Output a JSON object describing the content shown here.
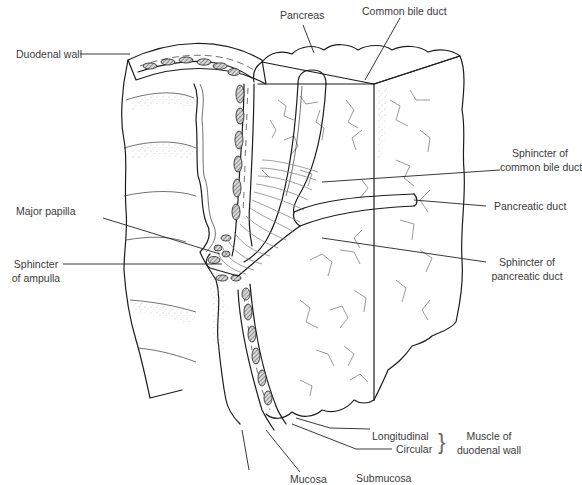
{
  "figure": {
    "style": "black line drawing on white",
    "colors": {
      "background": "#ffffff",
      "line": "#1c1c1c",
      "label_text": "#3b3b3b"
    }
  },
  "labels": {
    "duodenal_wall": "Duodenal wall",
    "pancreas": "Pancreas",
    "common_bile_duct": "Common bile duct",
    "sphincter_cbd_line1": "Sphincter of",
    "sphincter_cbd_line2": "common bile duct",
    "major_papilla": "Major papilla",
    "pancreatic_duct": "Pancreatic duct",
    "sphincter_ampulla_line1": "Sphincter",
    "sphincter_ampulla_line2": "of ampulla",
    "sphincter_pd_line1": "Sphincter of",
    "sphincter_pd_line2": "pancreatic duct",
    "longitudinal": "Longitudinal",
    "circular": "Circular",
    "muscle_line1": "Muscle of",
    "muscle_line2": "duodenal wall",
    "mucosa": "Mucosa",
    "submucosa": "Submucosa",
    "brace": "}"
  }
}
